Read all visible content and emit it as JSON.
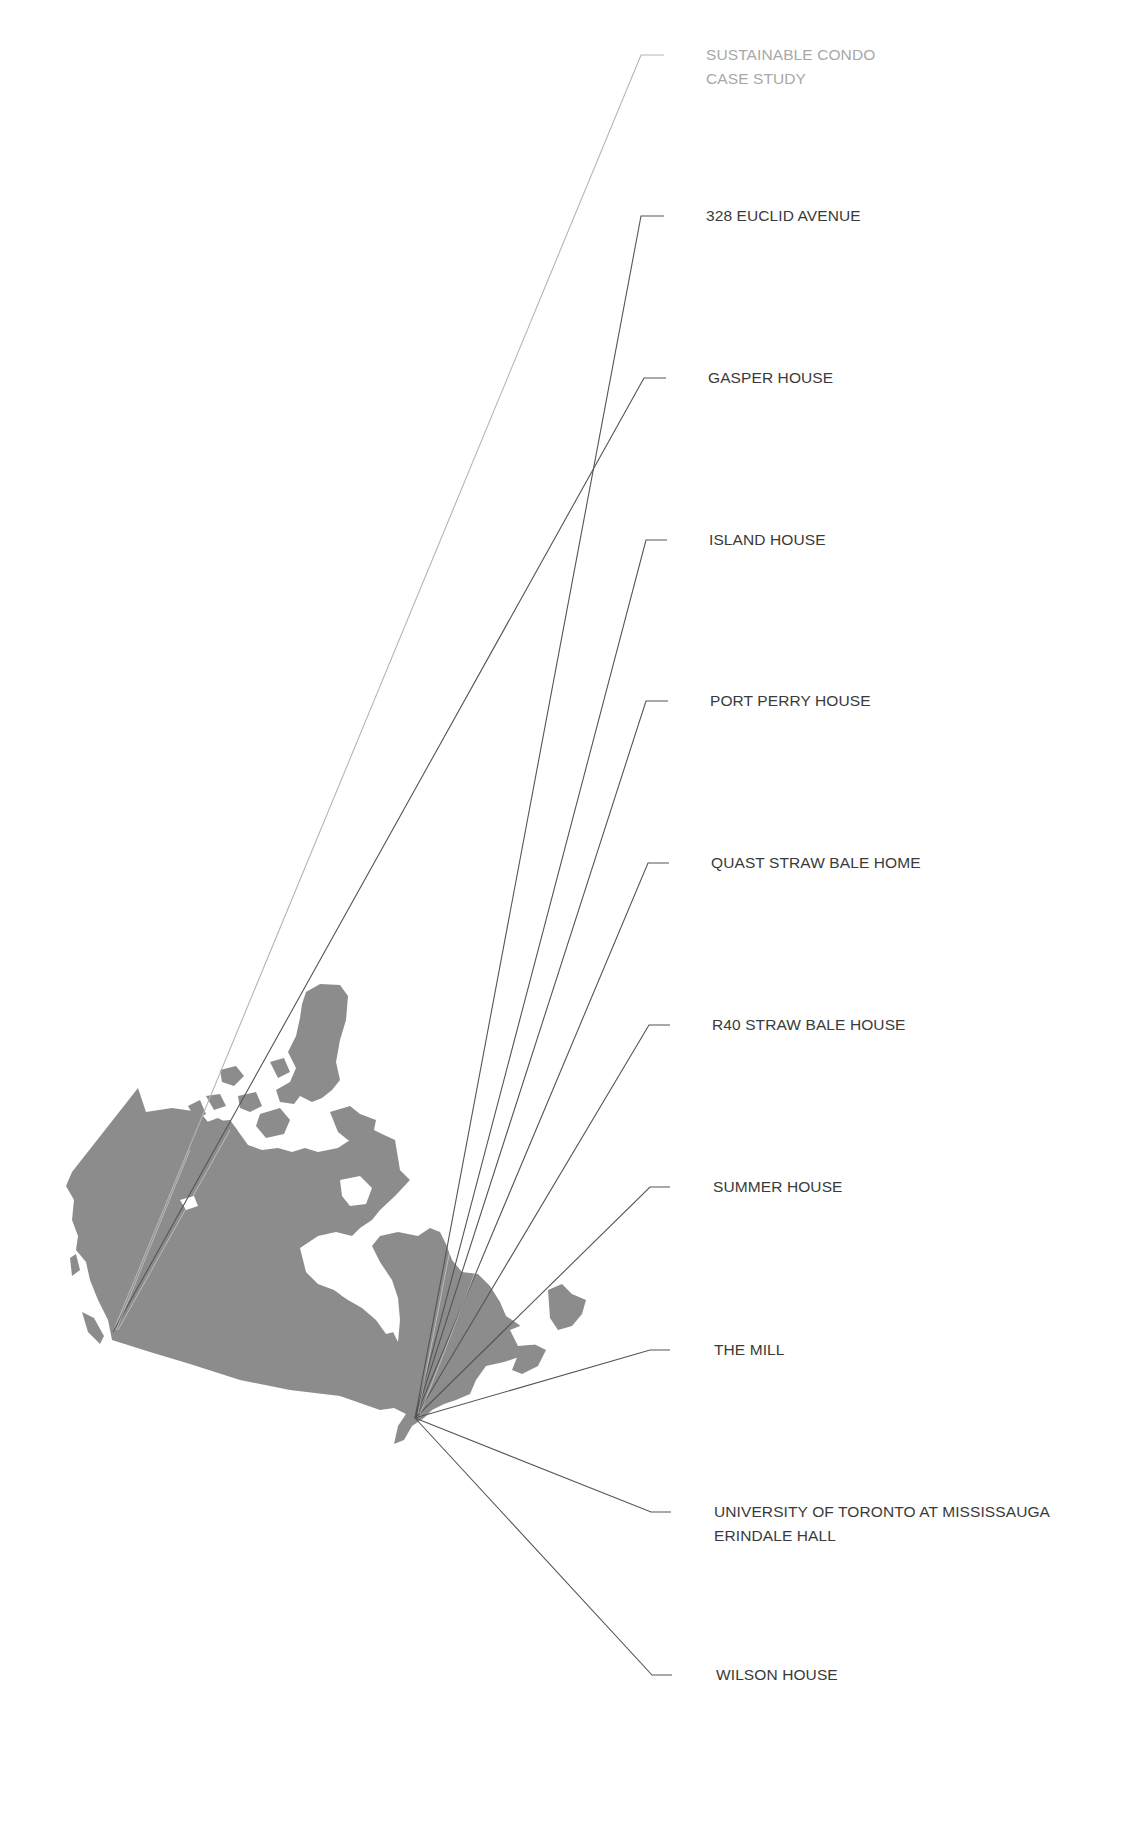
{
  "map": {
    "region": "Canada",
    "land_color": "#8c8c8c",
    "hub_point": {
      "x": 415,
      "y": 1418,
      "place": "Toronto area, Ontario"
    },
    "west_point": {
      "x": 113,
      "y": 1332,
      "place": "Vancouver area, British Columbia"
    }
  },
  "leader_color": "#555555",
  "leader_muted_color": "#b5b5b5",
  "projects": [
    {
      "line1": "SUSTAINABLE CONDO",
      "line2": "CASE STUDY",
      "muted": true,
      "label_y": 55,
      "elbow_x": 664,
      "from": "west"
    },
    {
      "line1": "328 EUCLID AVENUE",
      "line2": "",
      "muted": false,
      "label_y": 216,
      "elbow_x": 664,
      "from": "hub"
    },
    {
      "line1": "GASPER HOUSE",
      "line2": "",
      "muted": false,
      "label_y": 378,
      "elbow_x": 666,
      "from": "west"
    },
    {
      "line1": "ISLAND HOUSE",
      "line2": "",
      "muted": false,
      "label_y": 540,
      "elbow_x": 667,
      "from": "hub"
    },
    {
      "line1": "PORT PERRY HOUSE",
      "line2": "",
      "muted": false,
      "label_y": 701,
      "elbow_x": 668,
      "from": "hub"
    },
    {
      "line1": "QUAST STRAW BALE HOME",
      "line2": "",
      "muted": false,
      "label_y": 863,
      "elbow_x": 669,
      "from": "hub"
    },
    {
      "line1": "R40 STRAW BALE HOUSE",
      "line2": "",
      "muted": false,
      "label_y": 1025,
      "elbow_x": 670,
      "from": "hub"
    },
    {
      "line1": "SUMMER HOUSE",
      "line2": "",
      "muted": false,
      "label_y": 1187,
      "elbow_x": 670,
      "from": "hub"
    },
    {
      "line1": "THE MILL",
      "line2": "",
      "muted": false,
      "label_y": 1350,
      "elbow_x": 670,
      "from": "hub"
    },
    {
      "line1": "UNIVERSITY OF TORONTO AT MISSISSAUGA",
      "line2": "ERINDALE HALL",
      "muted": false,
      "label_y": 1512,
      "elbow_x": 671,
      "from": "hub"
    },
    {
      "line1": "WILSON HOUSE",
      "line2": "",
      "muted": false,
      "label_y": 1675,
      "elbow_x": 672,
      "from": "hub"
    }
  ]
}
